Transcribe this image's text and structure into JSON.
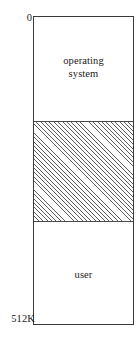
{
  "figure": {
    "name": "single-partition-memory-layout",
    "address_labels": {
      "top": "0",
      "bottom": "512K"
    },
    "regions": [
      {
        "id": "operating-system",
        "label": "operating\nsystem",
        "fill": "solid-white",
        "fill_color": "#ffffff",
        "start_address": "0",
        "end_address": ""
      },
      {
        "id": "hole",
        "label": "",
        "fill": "diagonal-hatch",
        "fill_color": "#5d5d5d",
        "start_address": "",
        "end_address": ""
      },
      {
        "id": "user",
        "label": "user",
        "fill": "solid-white",
        "fill_color": "#ffffff",
        "start_address": "",
        "end_address": "512K"
      }
    ],
    "colors": {
      "border": "#3a3a3a",
      "divider": "#4a4a4a",
      "hatch": "#5d5d5d",
      "background": "#ffffff",
      "text": "#1b1b1b"
    }
  }
}
